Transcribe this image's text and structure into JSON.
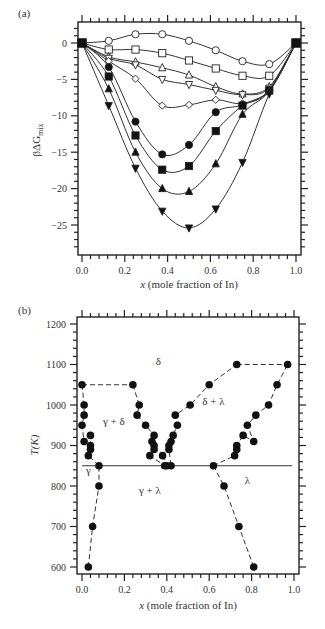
{
  "chart_data": [
    {
      "panel": "(a)",
      "type": "line",
      "title": "",
      "xlabel_italic": "x",
      "xlabel": " (mole fraction of In)",
      "ylabel": "βΔG",
      "ylabel_sub": "mix",
      "xlim": [
        0,
        1.0
      ],
      "ylim": [
        -28.5,
        2.5
      ],
      "xticks": [
        0.0,
        0.2,
        0.4,
        0.6,
        0.8,
        1.0
      ],
      "xtick_labels": [
        "0.0",
        "0.2",
        "0.4",
        "0.6",
        "0.8",
        "1.0"
      ],
      "yticks": [
        0,
        -5,
        -10,
        -15,
        -20,
        -25
      ],
      "ytick_labels": [
        "0",
        "−5",
        "−10",
        "−15",
        "−20",
        "−25"
      ],
      "grid": false,
      "x": [
        0,
        0.125,
        0.25,
        0.375,
        0.5,
        0.625,
        0.75,
        0.875,
        1.0
      ],
      "series": [
        {
          "name": "open-circle",
          "marker": "circle",
          "filled": false,
          "values": [
            0,
            0.3,
            1.2,
            1.2,
            0.3,
            -1.0,
            -2.5,
            -2.9,
            0
          ]
        },
        {
          "name": "open-square",
          "marker": "square",
          "filled": false,
          "values": [
            0,
            -0.9,
            -0.9,
            -1.4,
            -2.4,
            -3.5,
            -4.5,
            -4.5,
            0
          ]
        },
        {
          "name": "open-triangle-up",
          "marker": "triangle-up",
          "filled": false,
          "values": [
            0,
            -1.9,
            -2.6,
            -3.4,
            -4.4,
            -6.0,
            -7.0,
            -6.0,
            0
          ]
        },
        {
          "name": "open-triangle-down",
          "marker": "triangle-down",
          "filled": false,
          "values": [
            0,
            -2.1,
            -3.0,
            -5.0,
            -5.7,
            -6.5,
            -7.1,
            -6.2,
            0
          ]
        },
        {
          "name": "open-diamond",
          "marker": "diamond",
          "filled": false,
          "values": [
            0,
            -2.5,
            -4.9,
            -8.6,
            -8.5,
            -7.8,
            -8.3,
            -6.6,
            0
          ]
        },
        {
          "name": "filled-circle",
          "marker": "circle",
          "filled": true,
          "values": [
            0,
            -3.3,
            -10.8,
            -15.3,
            -14.0,
            -9.5,
            -8.5,
            -6.5,
            0
          ]
        },
        {
          "name": "filled-square",
          "marker": "square",
          "filled": true,
          "values": [
            0,
            -4.6,
            -12.7,
            -17.4,
            -16.9,
            -12.1,
            -8.6,
            -6.5,
            0
          ]
        },
        {
          "name": "filled-triangle-up",
          "marker": "triangle-up",
          "filled": true,
          "values": [
            0,
            -6.3,
            -15.0,
            -20.0,
            -20.4,
            -16.6,
            -9.8,
            -6.6,
            0
          ]
        },
        {
          "name": "filled-triangle-down",
          "marker": "triangle-down",
          "filled": true,
          "values": [
            0,
            -8.6,
            -17.2,
            -23.1,
            -25.4,
            -22.8,
            -16.4,
            -7.0,
            0
          ]
        }
      ]
    },
    {
      "panel": "(b)",
      "type": "scatter",
      "title": "",
      "xlabel_italic": "x",
      "xlabel": " (mole fraction of In)",
      "ylabel": "T(K)",
      "xlim": [
        0,
        1.0
      ],
      "ylim": [
        590,
        1220
      ],
      "xticks": [
        0.0,
        0.2,
        0.4,
        0.6,
        0.8,
        1.0
      ],
      "xtick_labels": [
        "0.0",
        "0.2",
        "0.4",
        "0.6",
        "0.8",
        "1.0"
      ],
      "yticks": [
        600,
        700,
        800,
        900,
        1000,
        1100,
        1200
      ],
      "ytick_labels": [
        "600",
        "700",
        "800",
        "900",
        "1000",
        "1100",
        "1200"
      ],
      "grid": false,
      "eutectic_line": {
        "T": 850,
        "x_from": 0.0,
        "x_to": 1.0
      },
      "boundaries": [
        {
          "name": "gamma-left",
          "points": [
            [
              0.03,
              600
            ],
            [
              0.05,
              700
            ],
            [
              0.08,
              800
            ],
            [
              0.08,
              850
            ]
          ]
        },
        {
          "name": "gamma-delta-left",
          "points": [
            [
              0.0,
              1050
            ],
            [
              0.01,
              1000
            ],
            [
              0.01,
              975
            ],
            [
              0.0,
              950
            ],
            [
              0.01,
              910
            ],
            [
              0.04,
              925
            ],
            [
              0.04,
              900
            ],
            [
              0.04,
              890
            ],
            [
              0.03,
              875
            ],
            [
              0.08,
              850
            ]
          ]
        },
        {
          "name": "delta-top-left",
          "points": [
            [
              0.0,
              1050
            ],
            [
              0.24,
              1050
            ]
          ]
        },
        {
          "name": "gamma-delta-right",
          "points": [
            [
              0.24,
              1050
            ],
            [
              0.27,
              1000
            ],
            [
              0.26,
              975
            ],
            [
              0.3,
              950
            ],
            [
              0.34,
              925
            ],
            [
              0.33,
              910
            ],
            [
              0.34,
              900
            ],
            [
              0.34,
              890
            ],
            [
              0.32,
              875
            ],
            [
              0.39,
              850
            ]
          ]
        },
        {
          "name": "delta-lambda-left",
          "points": [
            [
              0.38,
              875
            ],
            [
              0.4,
              850
            ],
            [
              0.42,
              850
            ],
            [
              0.41,
              890
            ],
            [
              0.41,
              900
            ],
            [
              0.42,
              910
            ],
            [
              0.43,
              925
            ],
            [
              0.45,
              950
            ],
            [
              0.44,
              975
            ],
            [
              0.51,
              1000
            ],
            [
              0.6,
              1050
            ],
            [
              0.73,
              1100
            ]
          ]
        },
        {
          "name": "delta-top-right",
          "points": [
            [
              0.73,
              1100
            ],
            [
              0.97,
              1100
            ]
          ]
        },
        {
          "name": "delta-lambda-right",
          "points": [
            [
              0.62,
              850
            ],
            [
              0.72,
              875
            ],
            [
              0.73,
              890
            ],
            [
              0.73,
              900
            ],
            [
              0.76,
              925
            ],
            [
              0.81,
              910
            ],
            [
              0.78,
              950
            ],
            [
              0.82,
              975
            ],
            [
              0.88,
              1000
            ],
            [
              0.92,
              1050
            ],
            [
              0.97,
              1100
            ]
          ]
        },
        {
          "name": "lambda-left",
          "points": [
            [
              0.62,
              850
            ],
            [
              0.67,
              800
            ],
            [
              0.74,
              700
            ],
            [
              0.81,
              600
            ]
          ]
        }
      ],
      "region_labels": [
        {
          "text": "δ",
          "x": 0.36,
          "T": 1100
        },
        {
          "text": "γ + δ",
          "x": 0.15,
          "T": 950
        },
        {
          "text": "δ + λ",
          "x": 0.62,
          "T": 1000
        },
        {
          "text": "γ",
          "x": 0.03,
          "T": 830
        },
        {
          "text": "γ + λ",
          "x": 0.32,
          "T": 780
        },
        {
          "text": "λ",
          "x": 0.78,
          "T": 805
        }
      ]
    }
  ]
}
